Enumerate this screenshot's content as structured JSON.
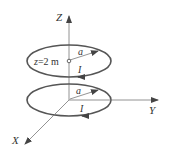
{
  "diagram": {
    "type": "two coaxial current loops",
    "axes": {
      "z_label": "Z",
      "y_label": "Y",
      "x_label": "X"
    },
    "top_loop": {
      "position_label_var": "z",
      "position_label_eq": "=2 m",
      "radius_label": "a",
      "current_label": "I"
    },
    "bottom_loop": {
      "radius_label": "a",
      "current_label": "I"
    },
    "colors": {
      "loop": "#555555",
      "axis": "#777777",
      "text": "#333333"
    }
  }
}
